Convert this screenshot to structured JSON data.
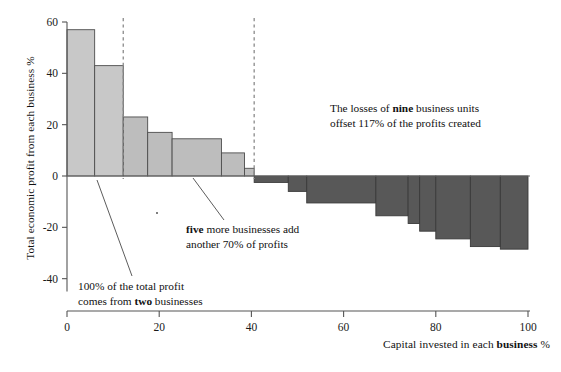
{
  "chart_data": {
    "type": "bar",
    "title": "",
    "xlabel": "Capital invested in each business %",
    "ylabel": "Total economic profit from each business %",
    "xlim": [
      0,
      100
    ],
    "ylim": [
      -45,
      62
    ],
    "xticks": [
      0,
      20,
      40,
      60,
      80,
      100
    ],
    "yticks": [
      60,
      40,
      20,
      0,
      -20,
      -40
    ],
    "ytick_labels": [
      "60",
      "40",
      "20",
      "0",
      "-20",
      "-40"
    ],
    "xtick_labels": [
      "0",
      "20",
      "40",
      "60",
      "80",
      "100"
    ],
    "grid": false,
    "legend": "none",
    "variable_width_bars": true,
    "bars": [
      {
        "index": 1,
        "x_start": 0,
        "x_end": 6.0,
        "value": 57,
        "group": "positive"
      },
      {
        "index": 2,
        "x_start": 6.0,
        "x_end": 12.2,
        "value": 43,
        "group": "positive"
      },
      {
        "index": 3,
        "x_start": 12.2,
        "x_end": 17.5,
        "value": 23,
        "group": "positive"
      },
      {
        "index": 4,
        "x_start": 17.5,
        "x_end": 22.8,
        "value": 17,
        "group": "positive"
      },
      {
        "index": 5,
        "x_start": 22.8,
        "x_end": 33.5,
        "value": 14.5,
        "group": "positive"
      },
      {
        "index": 6,
        "x_start": 33.5,
        "x_end": 38.5,
        "value": 9,
        "group": "positive"
      },
      {
        "index": 7,
        "x_start": 38.5,
        "x_end": 40.6,
        "value": 3,
        "group": "positive"
      },
      {
        "index": 8,
        "x_start": 40.6,
        "x_end": 48.0,
        "value": -2.5,
        "group": "negative"
      },
      {
        "index": 9,
        "x_start": 48.0,
        "x_end": 52.0,
        "value": -6,
        "group": "negative"
      },
      {
        "index": 10,
        "x_start": 52.0,
        "x_end": 67.0,
        "value": -10.5,
        "group": "negative"
      },
      {
        "index": 11,
        "x_start": 67.0,
        "x_end": 74.0,
        "value": -15.5,
        "group": "negative"
      },
      {
        "index": 12,
        "x_start": 74.0,
        "x_end": 76.5,
        "value": -18.5,
        "group": "negative"
      },
      {
        "index": 13,
        "x_start": 76.5,
        "x_end": 80.0,
        "value": -21.5,
        "group": "negative"
      },
      {
        "index": 14,
        "x_start": 80.0,
        "x_end": 87.5,
        "value": -24.5,
        "group": "negative"
      },
      {
        "index": 15,
        "x_start": 87.5,
        "x_end": 94.0,
        "value": -27.5,
        "group": "negative"
      },
      {
        "index": 16,
        "x_start": 94.0,
        "x_end": 100.0,
        "value": -28.5,
        "group": "negative"
      }
    ],
    "dividers": [
      {
        "x": 12.2,
        "style": "dashed"
      },
      {
        "x": 40.6,
        "style": "dashed"
      }
    ],
    "annotations": [
      {
        "id": "losses",
        "line1_pre": "The losses of ",
        "line1_bold": "nine",
        "line1_post": " business units",
        "line2": "offset 117% of the profits created"
      },
      {
        "id": "five",
        "line1_bold": "five",
        "line1_post": " more businesses add",
        "line2": "another 70% of profits"
      },
      {
        "id": "hundred",
        "line1": "100% of the total profit",
        "line2_pre": "comes from ",
        "line2_bold": "two",
        "line2_post": " businesses"
      }
    ],
    "colors": {
      "positive_bar_fill": "#bdbdbd",
      "negative_bar_fill": "#585858",
      "bar_stroke": "#4d4d4d",
      "axis": "#555555",
      "divider": "#8a8a8a",
      "text": "#111111",
      "background": "#ffffff"
    }
  }
}
